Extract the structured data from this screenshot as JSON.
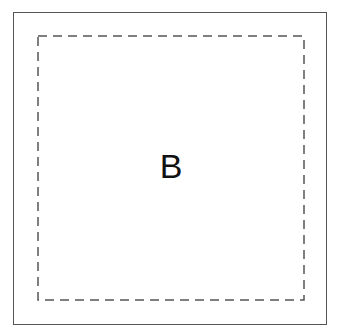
{
  "diagram": {
    "label": "B",
    "outer_border": {
      "style": "solid",
      "color": "#555555"
    },
    "inner_border": {
      "style": "dashed",
      "color": "#555555"
    }
  }
}
